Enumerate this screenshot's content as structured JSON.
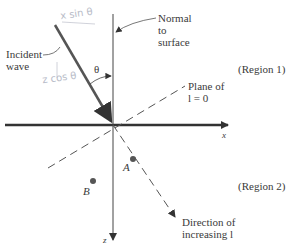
{
  "labels": {
    "incident": [
      "Incident",
      "wave"
    ],
    "normal": [
      "Normal",
      "to",
      "surface"
    ],
    "theta": "θ",
    "region1": "(Region 1)",
    "region2": "(Region 2)",
    "plane": [
      "Plane of",
      "l = 0"
    ],
    "x_axis": "x",
    "z_axis": "z",
    "point_a": "A",
    "point_b": "B",
    "direction": [
      "Direction of",
      "increasing l"
    ]
  },
  "annotations": {
    "x_sin": "x sin θ",
    "z_cos": "z cos θ"
  },
  "colors": {
    "axis": "#333333",
    "incident_wave": "#555555",
    "dashed": "#555555",
    "handwriting": "#b8bcc8"
  }
}
